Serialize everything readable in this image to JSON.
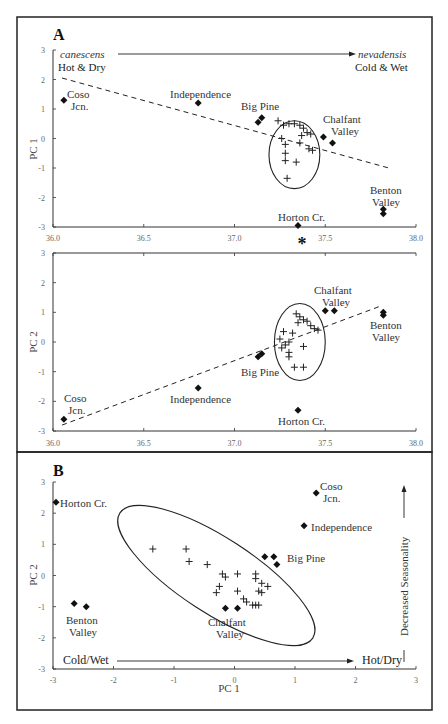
{
  "chart_data": [
    {
      "id": "A-top",
      "type": "scatter",
      "panel_label": "A",
      "xlabel": "",
      "ylabel": "PC 1",
      "xlim": [
        36.0,
        38.0
      ],
      "ylim": [
        -3,
        3
      ],
      "x_ticks": [
        "36.0",
        "36.5",
        "37.0",
        "37.5",
        "38.0"
      ],
      "y_ticks": [
        "3",
        "2",
        "1",
        "0",
        "-1",
        "-2",
        "-3"
      ],
      "grid": false,
      "annotations": {
        "left_species": "canescens",
        "left_climate": "Hot & Dry",
        "right_species": "nevadensis",
        "right_climate": "Cold & Wet",
        "asterisk": "*"
      },
      "asterisk_x": 37.35,
      "trend_line": [
        [
          36.05,
          2.05
        ],
        [
          37.85,
          -1.0
        ]
      ],
      "cluster_ellipse": {
        "center": [
          37.33,
          -0.55
        ],
        "semi_x": 0.14,
        "semi_y": 1.15
      },
      "cluster_points": [
        [
          37.24,
          0.6
        ],
        [
          37.27,
          0.45
        ],
        [
          37.3,
          0.5
        ],
        [
          37.33,
          0.5
        ],
        [
          37.36,
          0.45
        ],
        [
          37.38,
          0.35
        ],
        [
          37.4,
          0.2
        ],
        [
          37.42,
          0.15
        ],
        [
          37.37,
          0.1
        ],
        [
          37.26,
          0.0
        ],
        [
          37.28,
          -0.2
        ],
        [
          37.36,
          -0.15
        ],
        [
          37.41,
          -0.35
        ],
        [
          37.43,
          -0.4
        ],
        [
          37.28,
          -0.5
        ],
        [
          37.28,
          -0.75
        ],
        [
          37.34,
          -0.8
        ],
        [
          37.29,
          -1.35
        ]
      ],
      "sites": [
        {
          "name": "Coso Jcn.",
          "points": [
            [
              36.06,
              1.3
            ]
          ]
        },
        {
          "name": "Independence",
          "points": [
            [
              36.8,
              1.2
            ]
          ]
        },
        {
          "name": "Big Pine",
          "points": [
            [
              37.13,
              0.55
            ],
            [
              37.15,
              0.7
            ]
          ]
        },
        {
          "name": "Chalfant Valley",
          "points": [
            [
              37.49,
              0.05
            ],
            [
              37.54,
              -0.15
            ]
          ]
        },
        {
          "name": "Horton Cr.",
          "points": [
            [
              37.35,
              -2.95
            ]
          ]
        },
        {
          "name": "Benton Valley",
          "points": [
            [
              37.82,
              -2.4
            ],
            [
              37.82,
              -2.55
            ]
          ]
        }
      ]
    },
    {
      "id": "A-bottom",
      "type": "scatter",
      "xlabel": "",
      "ylabel": "PC 2",
      "xlim": [
        36.0,
        38.0
      ],
      "ylim": [
        -3,
        3
      ],
      "x_ticks": [
        "36.0",
        "36.5",
        "37.0",
        "37.5",
        "38.0"
      ],
      "y_ticks": [
        "3",
        "2",
        "1",
        "0",
        "-1",
        "-2",
        "-3"
      ],
      "grid": false,
      "trend_line": [
        [
          36.05,
          -2.8
        ],
        [
          37.8,
          1.2
        ]
      ],
      "cluster_ellipse": {
        "center": [
          37.36,
          0.0
        ],
        "semi_x": 0.14,
        "semi_y": 1.3
      },
      "cluster_points": [
        [
          37.34,
          0.95
        ],
        [
          37.36,
          0.85
        ],
        [
          37.38,
          0.75
        ],
        [
          37.4,
          0.7
        ],
        [
          37.35,
          0.65
        ],
        [
          37.42,
          0.55
        ],
        [
          37.44,
          0.45
        ],
        [
          37.46,
          0.4
        ],
        [
          37.27,
          0.35
        ],
        [
          37.32,
          0.3
        ],
        [
          37.25,
          0.1
        ],
        [
          37.3,
          0.0
        ],
        [
          37.28,
          -0.1
        ],
        [
          37.26,
          -0.2
        ],
        [
          37.38,
          -0.15
        ],
        [
          37.3,
          -0.35
        ],
        [
          37.3,
          -0.5
        ],
        [
          37.33,
          -0.85
        ],
        [
          37.38,
          -0.85
        ]
      ],
      "sites": [
        {
          "name": "Coso Jcn.",
          "points": [
            [
              36.06,
              -2.6
            ]
          ]
        },
        {
          "name": "Independence",
          "points": [
            [
              36.8,
              -1.55
            ]
          ]
        },
        {
          "name": "Big Pine",
          "points": [
            [
              37.13,
              -0.5
            ],
            [
              37.15,
              -0.4
            ]
          ]
        },
        {
          "name": "Horton Cr.",
          "points": [
            [
              37.35,
              -2.3
            ]
          ]
        },
        {
          "name": "Chalfant Valley",
          "points": [
            [
              37.5,
              1.05
            ],
            [
              37.55,
              1.05
            ]
          ]
        },
        {
          "name": "Benton Valley",
          "points": [
            [
              37.82,
              1.0
            ],
            [
              37.82,
              0.9
            ]
          ]
        }
      ]
    },
    {
      "id": "B",
      "type": "scatter",
      "panel_label": "B",
      "xlabel": "PC 1",
      "ylabel": "PC 2",
      "xlim": [
        -3,
        3
      ],
      "ylim": [
        -3,
        3
      ],
      "x_ticks": [
        "-3",
        "-2",
        "-1",
        "0",
        "1",
        "2",
        "3"
      ],
      "y_ticks": [
        "3",
        "2",
        "1",
        "0",
        "-1",
        "-2",
        "-3"
      ],
      "grid": false,
      "annotations": {
        "left_axis_arrow": "Cold/Wet",
        "right_axis_arrow": "Hot/Dry",
        "vertical_arrow": "Decreased Seasonality"
      },
      "cluster_ellipse": {
        "center": [
          -0.3,
          0.0
        ],
        "semi_major": 1.9,
        "semi_minor": 0.62,
        "angle_deg": -33
      },
      "cluster_points": [
        [
          -1.35,
          0.85
        ],
        [
          -0.8,
          0.85
        ],
        [
          -0.75,
          0.45
        ],
        [
          -0.45,
          0.35
        ],
        [
          -0.2,
          0.05
        ],
        [
          -0.15,
          -0.05
        ],
        [
          0.05,
          0.05
        ],
        [
          0.35,
          0.05
        ],
        [
          0.35,
          -0.1
        ],
        [
          0.45,
          -0.25
        ],
        [
          0.4,
          -0.5
        ],
        [
          0.45,
          -0.55
        ],
        [
          0.55,
          -0.35
        ],
        [
          -0.25,
          -0.35
        ],
        [
          -0.3,
          -0.55
        ],
        [
          0.05,
          -0.5
        ],
        [
          0.15,
          -0.75
        ],
        [
          0.2,
          -0.85
        ],
        [
          0.3,
          -0.95
        ],
        [
          0.35,
          -0.95
        ],
        [
          0.4,
          -0.95
        ]
      ],
      "sites": [
        {
          "name": "Horton Cr.",
          "points": [
            [
              -2.95,
              2.35
            ]
          ]
        },
        {
          "name": "Coso Jcn.",
          "points": [
            [
              1.35,
              2.65
            ]
          ]
        },
        {
          "name": "Independence",
          "points": [
            [
              1.15,
              1.6
            ]
          ]
        },
        {
          "name": "Big Pine",
          "points": [
            [
              0.5,
              0.6
            ],
            [
              0.65,
              0.6
            ],
            [
              0.7,
              0.35
            ]
          ]
        },
        {
          "name": "Benton Valley",
          "points": [
            [
              -2.65,
              -0.9
            ],
            [
              -2.45,
              -1.0
            ]
          ]
        },
        {
          "name": "Chalfant Valley",
          "points": [
            [
              -0.15,
              -1.05
            ],
            [
              0.05,
              -1.05
            ]
          ]
        }
      ]
    }
  ],
  "labels": {
    "panel_a": "A",
    "panel_b": "B",
    "pc1": "PC 1",
    "pc2": "PC 2",
    "canescens": "canescens",
    "hot_dry": "Hot & Dry",
    "nevadensis": "nevadensis",
    "cold_wet": "Cold & Wet",
    "cold_wet_b": "Cold/Wet",
    "hot_dry_b": "Hot/Dry",
    "seasonality": "Decreased Seasonality",
    "asterisk": "*",
    "coso1": "Coso",
    "coso2": "Jcn.",
    "independence": "Independence",
    "big_pine": "Big Pine",
    "chalfant1": "Chalfant",
    "chalfant2": "Valley",
    "benton1": "Benton",
    "benton2": "Valley",
    "horton": "Horton Cr."
  }
}
